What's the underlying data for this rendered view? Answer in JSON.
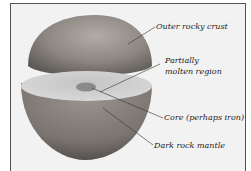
{
  "figure": {
    "labels": [
      {
        "id": "crust",
        "text": "Outer rocky crust"
      },
      {
        "id": "molten",
        "line1": "Partially",
        "line2": "molten region"
      },
      {
        "id": "core",
        "text": "Core (perhaps iron)"
      },
      {
        "id": "mantle",
        "text": "Dark rock mantle"
      }
    ]
  },
  "colors": {
    "background": "#f2f2f2",
    "surface_dark": "#6e6a66",
    "surface_light": "#a8a4a0",
    "cut_face": "#cfcfcf",
    "core": "#8a8a8a",
    "leader": "#333333"
  }
}
